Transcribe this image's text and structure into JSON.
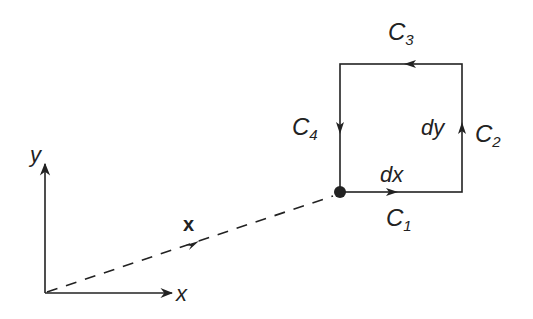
{
  "diagram": {
    "axes": {
      "x_label": "x",
      "y_label": "y"
    },
    "position_vector": {
      "label": "x"
    },
    "contour": {
      "segments": [
        {
          "name": "C",
          "sub": "1",
          "direction": "right"
        },
        {
          "name": "C",
          "sub": "2",
          "direction": "up"
        },
        {
          "name": "C",
          "sub": "3",
          "direction": "left"
        },
        {
          "name": "C",
          "sub": "4",
          "direction": "down"
        }
      ],
      "dx_label": "dx",
      "dy_label": "dy"
    },
    "colors": {
      "stroke": "#222222",
      "background": "#ffffff"
    }
  }
}
